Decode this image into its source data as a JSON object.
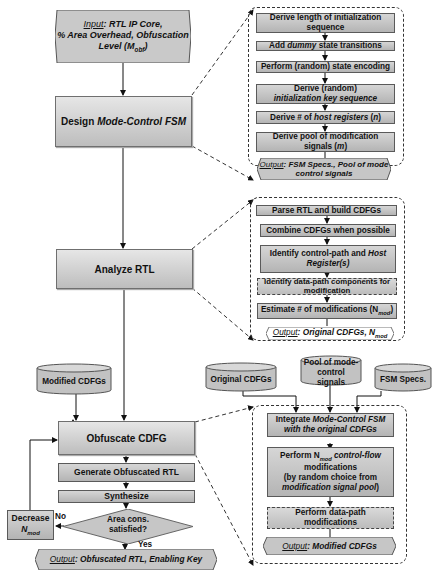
{
  "input": {
    "label": "Input",
    "line1": ": RTL IP Core,",
    "line2": "% Area Overhead, Obfuscation",
    "line3": "Level (M",
    "line3_sub": "obf",
    "line3_end": ")"
  },
  "main_steps": {
    "design_fsm": {
      "pre": "Design ",
      "italic": "Mode-Control FSM",
      "post": ""
    },
    "analyze_rtl": "Analyze RTL",
    "obfuscate_cdfg": "Obfuscate CDFG",
    "generate_rtl": "Generate Obfuscated RTL",
    "synthesize": "Synthesize",
    "decision": {
      "line1": "Area cons.",
      "line2": "satisfied?",
      "no": "No",
      "yes": "Yes"
    },
    "decrease": {
      "line1": "Decrease",
      "line2": "N",
      "line2_sub": "mod"
    },
    "final_output": {
      "label": "Output",
      "text": ": Obfuscated RTL, Enabling Key"
    }
  },
  "fsm_group": {
    "steps": [
      {
        "text": "Derive length of initialization sequence"
      },
      {
        "pre": "Add ",
        "italic": "dummy",
        "post": " state transitions"
      },
      {
        "text": "Perform (random) state encoding"
      },
      {
        "line1": "Derive (random)",
        "italic": "initialization key sequence"
      },
      {
        "pre": "Derive # of ",
        "italic": "host registers",
        "post": " (",
        "var": "n",
        "end": ")"
      },
      {
        "line1": "Derive pool of modification",
        "line2": "signals (",
        "var": "m",
        "end": ")"
      }
    ],
    "output": {
      "label": "Output",
      "text": ": FSM Specs., Pool of mode control signals"
    }
  },
  "analyze_group": {
    "steps": [
      {
        "text": "Parse RTL and build CDFGs"
      },
      {
        "text": "Combine CDFGs when possible"
      },
      {
        "pre": "Identify control-path and ",
        "italic1": "Host",
        "italic2": "Register",
        "post": "(s)"
      },
      {
        "text": "Identify data-path components for modification",
        "dashed": true
      },
      {
        "pre": "Estimate # of modifications (N",
        "sub": "mod",
        "post": ")"
      }
    ],
    "output": {
      "label": "Output",
      "text": ": Original CDFGs, N",
      "sub": "mod"
    }
  },
  "databases": {
    "modified_cdfgs": "Modified CDFGs",
    "original_cdfgs": "Original CDFGs",
    "pool_signals": "Pool of mode-control signals",
    "fsm_specs": "FSM Specs."
  },
  "obfuscate_group": {
    "steps": [
      {
        "pre": "Integrate ",
        "italic1": "Mode-Control FSM",
        "italic2": "with the original CDFGs"
      },
      {
        "pre": "Perform N",
        "sub": "mod",
        "italic": " control-flow",
        "line2": "modifications",
        "line3": "(by random choice from",
        "italic4": "modification signal pool",
        "end4": ")"
      },
      {
        "text": "Perform data-path modifications",
        "dashed": true
      }
    ],
    "output": {
      "label": "Output",
      "text": ": Modified CDFGs"
    }
  },
  "colors": {
    "box_top": "#e6e6e6",
    "box_bottom": "#bdbdbd",
    "border": "#5a5a5a",
    "dash": "#333333"
  }
}
